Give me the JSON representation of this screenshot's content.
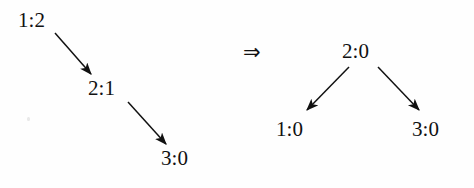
{
  "diagram": {
    "operator": "⇒",
    "left_tree": {
      "name": "before",
      "nodes": [
        {
          "id": "l-root",
          "label": "1:2"
        },
        {
          "id": "l-mid",
          "label": "2:1"
        },
        {
          "id": "l-leaf",
          "label": "3:0"
        }
      ],
      "edges": [
        {
          "from": "l-root",
          "to": "l-mid",
          "x1": 55,
          "y1": 33,
          "x2": 91,
          "y2": 74
        },
        {
          "from": "l-mid",
          "to": "l-leaf",
          "x1": 128,
          "y1": 102,
          "x2": 166,
          "y2": 144
        }
      ]
    },
    "right_tree": {
      "name": "after",
      "nodes": [
        {
          "id": "r-root",
          "label": "2:0"
        },
        {
          "id": "r-left",
          "label": "1:0"
        },
        {
          "id": "r-right",
          "label": "3:0"
        }
      ],
      "edges": [
        {
          "from": "r-root",
          "to": "r-left",
          "x1": 349,
          "y1": 67,
          "x2": 307,
          "y2": 110
        },
        {
          "from": "r-root",
          "to": "r-right",
          "x1": 378,
          "y1": 67,
          "x2": 419,
          "y2": 110
        }
      ]
    },
    "colors": {
      "ink": "#111111",
      "background": "#fefefe"
    }
  }
}
